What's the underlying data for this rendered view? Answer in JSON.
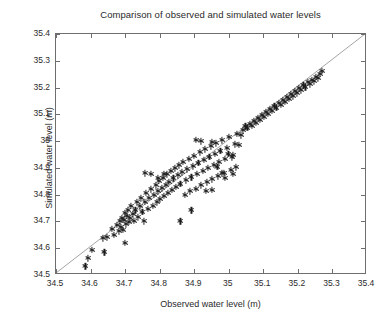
{
  "chart_data": {
    "type": "scatter",
    "title": "Comparison of observed and simulated water levels",
    "xlabel": "Observed water level (m)",
    "ylabel": "Simulated water level (m)",
    "xlim": [
      34.5,
      35.4
    ],
    "ylim": [
      34.5,
      35.4
    ],
    "xticks": [
      34.5,
      34.6,
      34.7,
      34.8,
      34.9,
      35,
      35.1,
      35.2,
      35.3,
      35.4
    ],
    "yticks": [
      34.5,
      34.6,
      34.7,
      34.8,
      34.9,
      35,
      35.1,
      35.2,
      35.3,
      35.4
    ],
    "xticklabels": [
      "34.5",
      "34.6",
      "34.7",
      "34.8",
      "34.9",
      "35",
      "35.1",
      "35.2",
      "35.3",
      "35.4"
    ],
    "yticklabels": [
      "34.5",
      "34.6",
      "34.7",
      "34.8",
      "34.9",
      "35",
      "35.1",
      "35.2",
      "35.3",
      "35.4"
    ],
    "grid": false,
    "legend": null,
    "marker": "asterisk",
    "marker_color": "#1d1d1d",
    "axes_color": "#6e6e6e",
    "reference_line": {
      "name": "1:1 identity line",
      "color": "#8c8c8c",
      "from": [
        34.5,
        34.5
      ],
      "to": [
        35.4,
        35.4
      ]
    },
    "series": [
      {
        "name": "Observed vs simulated water level",
        "points": [
          [
            34.585,
            34.533
          ],
          [
            34.592,
            34.563
          ],
          [
            34.604,
            34.593
          ],
          [
            34.635,
            34.637
          ],
          [
            34.648,
            34.641
          ],
          [
            34.662,
            34.672
          ],
          [
            34.668,
            34.651
          ],
          [
            34.676,
            34.688
          ],
          [
            34.681,
            34.663
          ],
          [
            34.684,
            34.7
          ],
          [
            34.688,
            34.679
          ],
          [
            34.69,
            34.714
          ],
          [
            34.693,
            34.668
          ],
          [
            34.697,
            34.706
          ],
          [
            34.7,
            34.731
          ],
          [
            34.703,
            34.69
          ],
          [
            34.706,
            34.722
          ],
          [
            34.709,
            34.744
          ],
          [
            34.712,
            34.699
          ],
          [
            34.715,
            34.712
          ],
          [
            34.718,
            34.758
          ],
          [
            34.722,
            34.727
          ],
          [
            34.726,
            34.703
          ],
          [
            34.73,
            34.742
          ],
          [
            34.734,
            34.772
          ],
          [
            34.738,
            34.716
          ],
          [
            34.742,
            34.757
          ],
          [
            34.746,
            34.786
          ],
          [
            34.75,
            34.735
          ],
          [
            34.754,
            34.7
          ],
          [
            34.757,
            34.773
          ],
          [
            34.761,
            34.806
          ],
          [
            34.765,
            34.747
          ],
          [
            34.77,
            34.789
          ],
          [
            34.775,
            34.82
          ],
          [
            34.78,
            34.758
          ],
          [
            34.784,
            34.8
          ],
          [
            34.788,
            34.835
          ],
          [
            34.792,
            34.771
          ],
          [
            34.795,
            34.812
          ],
          [
            34.799,
            34.851
          ],
          [
            34.802,
            34.783
          ],
          [
            34.806,
            34.824
          ],
          [
            34.81,
            34.862
          ],
          [
            34.813,
            34.795
          ],
          [
            34.817,
            34.836
          ],
          [
            34.82,
            34.876
          ],
          [
            34.824,
            34.806
          ],
          [
            34.828,
            34.848
          ],
          [
            34.832,
            34.888
          ],
          [
            34.836,
            34.818
          ],
          [
            34.84,
            34.861
          ],
          [
            34.844,
            34.899
          ],
          [
            34.848,
            34.83
          ],
          [
            34.852,
            34.872
          ],
          [
            34.856,
            34.91
          ],
          [
            34.86,
            34.841
          ],
          [
            34.864,
            34.884
          ],
          [
            34.868,
            34.922
          ],
          [
            34.872,
            34.8
          ],
          [
            34.876,
            34.853
          ],
          [
            34.88,
            34.895
          ],
          [
            34.884,
            34.934
          ],
          [
            34.888,
            34.812
          ],
          [
            34.892,
            34.865
          ],
          [
            34.896,
            34.906
          ],
          [
            34.9,
            34.946
          ],
          [
            34.904,
            34.823
          ],
          [
            34.908,
            34.877
          ],
          [
            34.912,
            34.918
          ],
          [
            34.916,
            34.958
          ],
          [
            34.92,
            34.835
          ],
          [
            34.924,
            34.888
          ],
          [
            34.928,
            34.93
          ],
          [
            34.932,
            34.969
          ],
          [
            34.936,
            34.846
          ],
          [
            34.94,
            34.9
          ],
          [
            34.944,
            34.941
          ],
          [
            34.948,
            34.98
          ],
          [
            34.952,
            34.858
          ],
          [
            34.956,
            34.911
          ],
          [
            34.96,
            34.953
          ],
          [
            34.964,
            34.992
          ],
          [
            34.968,
            34.869
          ],
          [
            34.972,
            34.923
          ],
          [
            34.976,
            34.964
          ],
          [
            34.98,
            35.003
          ],
          [
            34.985,
            34.881
          ],
          [
            34.99,
            34.935
          ],
          [
            34.995,
            34.976
          ],
          [
            35.0,
            35.015
          ],
          [
            35.006,
            34.893
          ],
          [
            35.012,
            34.947
          ],
          [
            35.018,
            34.988
          ],
          [
            35.024,
            35.027
          ],
          [
            35.03,
            34.986
          ],
          [
            35.036,
            35.022
          ],
          [
            35.042,
            35.041
          ],
          [
            35.048,
            35.055
          ],
          [
            35.054,
            35.049
          ],
          [
            35.06,
            35.065
          ],
          [
            35.066,
            35.058
          ],
          [
            35.072,
            35.076
          ],
          [
            35.078,
            35.069
          ],
          [
            35.084,
            35.087
          ],
          [
            35.09,
            35.08
          ],
          [
            35.096,
            35.098
          ],
          [
            35.102,
            35.091
          ],
          [
            35.108,
            35.109
          ],
          [
            35.114,
            35.102
          ],
          [
            35.12,
            35.12
          ],
          [
            35.126,
            35.113
          ],
          [
            35.132,
            35.131
          ],
          [
            35.138,
            35.124
          ],
          [
            35.144,
            35.142
          ],
          [
            35.15,
            35.135
          ],
          [
            35.156,
            35.153
          ],
          [
            35.162,
            35.146
          ],
          [
            35.168,
            35.164
          ],
          [
            35.174,
            35.157
          ],
          [
            35.18,
            35.175
          ],
          [
            35.186,
            35.168
          ],
          [
            35.192,
            35.186
          ],
          [
            35.198,
            35.179
          ],
          [
            35.204,
            35.197
          ],
          [
            35.21,
            35.19
          ],
          [
            35.216,
            35.208
          ],
          [
            35.222,
            35.201
          ],
          [
            35.228,
            35.219
          ],
          [
            35.234,
            35.212
          ],
          [
            35.24,
            35.23
          ],
          [
            35.246,
            35.223
          ],
          [
            35.252,
            35.241
          ],
          [
            35.258,
            35.234
          ],
          [
            35.264,
            35.252
          ],
          [
            35.27,
            35.262
          ],
          [
            34.795,
            34.862
          ],
          [
            34.812,
            34.876
          ],
          [
            34.758,
            34.88
          ],
          [
            34.775,
            34.879
          ],
          [
            34.905,
            35.005
          ],
          [
            34.92,
            34.999
          ],
          [
            34.952,
            34.998
          ],
          [
            34.967,
            34.905
          ],
          [
            34.999,
            34.952
          ],
          [
            35.008,
            34.94
          ],
          [
            34.86,
            34.7
          ],
          [
            34.892,
            34.742
          ],
          [
            34.935,
            34.815
          ],
          [
            34.95,
            34.818
          ],
          [
            34.98,
            34.88
          ],
          [
            34.99,
            34.862
          ],
          [
            35.012,
            34.878
          ],
          [
            35.02,
            34.902
          ],
          [
            34.7,
            34.62
          ],
          [
            34.64,
            34.585
          ]
        ]
      }
    ]
  }
}
